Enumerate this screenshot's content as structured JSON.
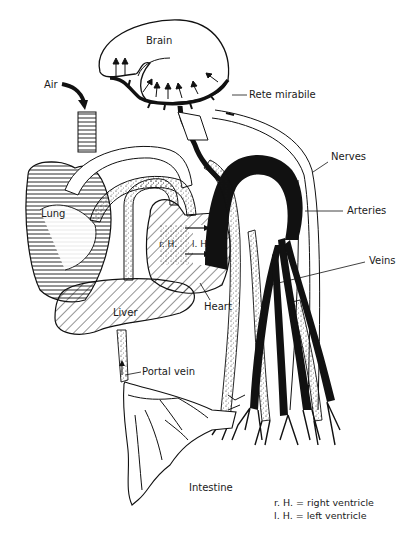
{
  "diagram": {
    "labels": {
      "brain": "Brain",
      "air": "Air",
      "rete_mirabile": "Rete mirabile",
      "nerves": "Nerves",
      "lung": "Lung",
      "arteries": "Arteries",
      "right_ventricle_abbr": "r. H.",
      "left_ventricle_abbr": "l. H.",
      "veins": "Veins",
      "heart": "Heart",
      "liver": "Liver",
      "portal_vein": "Portal vein",
      "intestine": "Intestine"
    },
    "legend": [
      "r. H. = right ventricle",
      "l. H. = left ventricle"
    ],
    "colors": {
      "ink": "#111111",
      "background": "#ffffff"
    }
  }
}
